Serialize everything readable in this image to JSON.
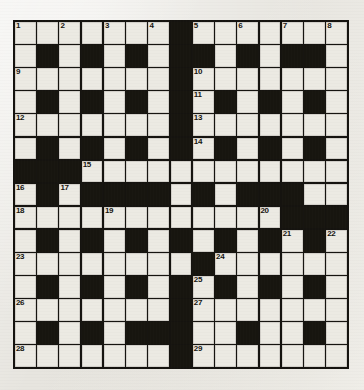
{
  "puzzle": {
    "title": "Crossword Grid",
    "type": "crossword",
    "rows": 15,
    "columns": 15,
    "colors": {
      "block": "#17150f",
      "open_cell": "#eceae3",
      "grid_line": "#15130f",
      "paper_background": "#e7e5df",
      "number_text": "#16140f"
    },
    "legend": {
      "block_symbol": "#",
      "open_symbol": "."
    },
    "grid": [
      "  .......#.......",
      ".#.#.#.##.#.#.#.",
      ".......#........",
      ".#.#.#.#.#.#.#.#",
      ".......#........",
      ".#.#.#.#.#.#.#.#",
      "###............",
      ".#.####.#.###.#.",
      "............###",
      ".#.#.#.#.#.#.#.#",
      "........#.......",
      ".#.#.#.#.#.#.#.#",
      ".......#........",
      ".#.#.##.##.#.##.",
      ".......#........"
    ],
    "grid_rows": [
      [
        "open",
        "open",
        "open",
        "open",
        "open",
        "open",
        "open",
        "block",
        "open",
        "open",
        "open",
        "open",
        "open",
        "open",
        "open"
      ],
      [
        "open",
        "block",
        "open",
        "block",
        "open",
        "block",
        "open",
        "block",
        "block",
        "open",
        "block",
        "open",
        "block",
        "block",
        "open"
      ],
      [
        "open",
        "open",
        "open",
        "open",
        "open",
        "open",
        "open",
        "block",
        "open",
        "open",
        "open",
        "open",
        "open",
        "open",
        "open"
      ],
      [
        "open",
        "block",
        "open",
        "block",
        "open",
        "block",
        "open",
        "block",
        "open",
        "block",
        "open",
        "block",
        "open",
        "block",
        "open"
      ],
      [
        "open",
        "open",
        "open",
        "open",
        "open",
        "open",
        "open",
        "block",
        "open",
        "open",
        "open",
        "open",
        "open",
        "open",
        "open"
      ],
      [
        "open",
        "block",
        "open",
        "block",
        "open",
        "block",
        "open",
        "block",
        "open",
        "block",
        "open",
        "block",
        "open",
        "block",
        "open"
      ],
      [
        "block",
        "block",
        "block",
        "open",
        "open",
        "open",
        "open",
        "open",
        "open",
        "open",
        "open",
        "open",
        "open",
        "open",
        "open"
      ],
      [
        "open",
        "block",
        "open",
        "block",
        "block",
        "block",
        "block",
        "open",
        "block",
        "open",
        "block",
        "block",
        "block",
        "open",
        "open"
      ],
      [
        "open",
        "open",
        "open",
        "open",
        "open",
        "open",
        "open",
        "open",
        "open",
        "open",
        "open",
        "open",
        "block",
        "block",
        "block"
      ],
      [
        "open",
        "block",
        "open",
        "block",
        "open",
        "block",
        "open",
        "block",
        "open",
        "block",
        "open",
        "block",
        "open",
        "block",
        "open"
      ],
      [
        "open",
        "open",
        "open",
        "open",
        "open",
        "open",
        "open",
        "open",
        "block",
        "open",
        "open",
        "open",
        "open",
        "open",
        "open"
      ],
      [
        "open",
        "block",
        "open",
        "block",
        "open",
        "block",
        "open",
        "block",
        "open",
        "block",
        "open",
        "block",
        "open",
        "block",
        "open"
      ],
      [
        "open",
        "open",
        "open",
        "open",
        "open",
        "open",
        "open",
        "block",
        "open",
        "open",
        "open",
        "open",
        "open",
        "open",
        "open"
      ],
      [
        "open",
        "block",
        "open",
        "block",
        "open",
        "block",
        "block",
        "block",
        "open",
        "open",
        "block",
        "open",
        "open",
        "block",
        "open"
      ],
      [
        "open",
        "open",
        "open",
        "open",
        "open",
        "open",
        "open",
        "block",
        "open",
        "open",
        "open",
        "open",
        "open",
        "open",
        "open"
      ]
    ],
    "numbers": [
      {
        "label": "1",
        "row": 1,
        "col": 1
      },
      {
        "label": "2",
        "row": 1,
        "col": 3
      },
      {
        "label": "3",
        "row": 1,
        "col": 5
      },
      {
        "label": "4",
        "row": 1,
        "col": 7
      },
      {
        "label": "5",
        "row": 1,
        "col": 9
      },
      {
        "label": "6",
        "row": 1,
        "col": 11
      },
      {
        "label": "7",
        "row": 1,
        "col": 13
      },
      {
        "label": "8",
        "row": 1,
        "col": 15
      },
      {
        "label": "9",
        "row": 3,
        "col": 1
      },
      {
        "label": "10",
        "row": 3,
        "col": 9
      },
      {
        "label": "11",
        "row": 4,
        "col": 9
      },
      {
        "label": "12",
        "row": 5,
        "col": 1
      },
      {
        "label": "13",
        "row": 5,
        "col": 9
      },
      {
        "label": "14",
        "row": 6,
        "col": 9
      },
      {
        "label": "15",
        "row": 7,
        "col": 4
      },
      {
        "label": "16",
        "row": 8,
        "col": 1
      },
      {
        "label": "17",
        "row": 8,
        "col": 3
      },
      {
        "label": "18",
        "row": 9,
        "col": 1
      },
      {
        "label": "19",
        "row": 9,
        "col": 5
      },
      {
        "label": "20",
        "row": 9,
        "col": 12
      },
      {
        "label": "21",
        "row": 10,
        "col": 13
      },
      {
        "label": "22",
        "row": 10,
        "col": 15
      },
      {
        "label": "23",
        "row": 11,
        "col": 1
      },
      {
        "label": "24",
        "row": 11,
        "col": 10
      },
      {
        "label": "25",
        "row": 12,
        "col": 9
      },
      {
        "label": "26",
        "row": 13,
        "col": 1
      },
      {
        "label": "27",
        "row": 13,
        "col": 9
      },
      {
        "label": "28",
        "row": 15,
        "col": 1
      },
      {
        "label": "29",
        "row": 15,
        "col": 9
      }
    ]
  }
}
